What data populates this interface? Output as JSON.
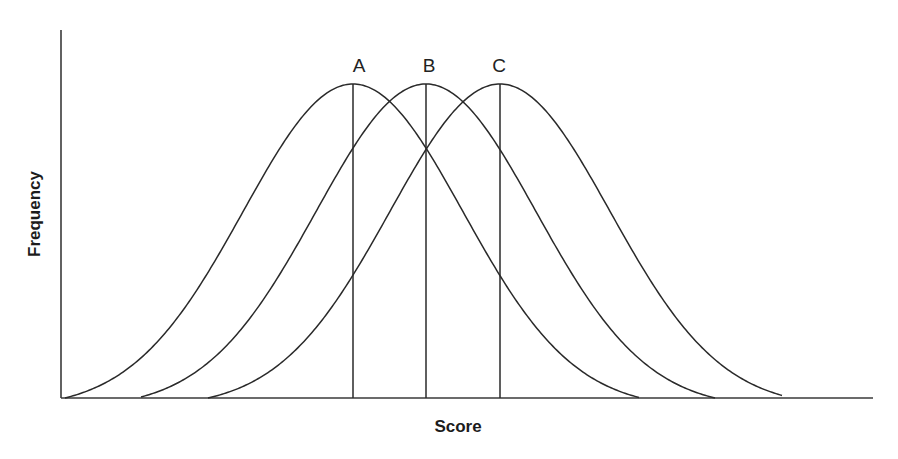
{
  "chart_data": {
    "type": "line",
    "title": "",
    "xlabel": "Score",
    "ylabel": "Frequency",
    "grid": false,
    "legend": "none",
    "x_ticks": [],
    "y_ticks": [],
    "series": [
      {
        "name": "A",
        "mean_px": 353,
        "start_px": 65,
        "end_px": 640,
        "label": "A"
      },
      {
        "name": "B",
        "mean_px": 426,
        "start_px": 141,
        "end_px": 715,
        "label": "B"
      },
      {
        "name": "C",
        "mean_px": 500,
        "start_px": 208,
        "end_px": 783,
        "label": "C"
      }
    ],
    "sigma_px": 110,
    "peak_y_px": 84,
    "baseline_y_px": 398,
    "axis": {
      "x0": 61,
      "x1": 873,
      "y_top": 30
    }
  },
  "labels": {
    "xlabel": "Score",
    "ylabel": "Frequency",
    "curveA": "A",
    "curveB": "B",
    "curveC": "C"
  }
}
